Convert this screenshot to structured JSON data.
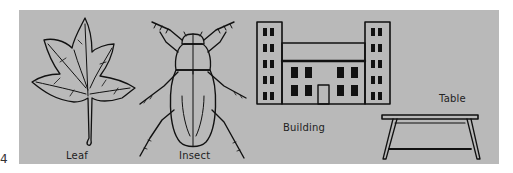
{
  "figure": {
    "marker": "4",
    "panel_color": "#b9b9b9",
    "line_color": "#111111",
    "items": [
      {
        "id": "leaf",
        "label": "Leaf"
      },
      {
        "id": "insect",
        "label": "Insect"
      },
      {
        "id": "building",
        "label": "Building"
      },
      {
        "id": "table",
        "label": "Table"
      }
    ]
  }
}
